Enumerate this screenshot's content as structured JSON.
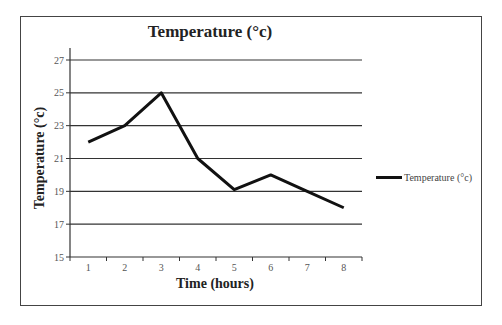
{
  "chart_data": {
    "type": "line",
    "title": "Temperature (°c)",
    "xlabel": "Time (hours)",
    "ylabel": "Temperature (°c)",
    "categories": [
      "1",
      "2",
      "3",
      "4",
      "5",
      "6",
      "7",
      "8"
    ],
    "series": [
      {
        "name": "Temperature (°c)",
        "values": [
          22,
          23,
          25,
          21,
          19.1,
          20,
          19,
          18
        ],
        "color": "#111111"
      }
    ],
    "yticks": [
      15,
      17,
      19,
      21,
      23,
      25,
      27
    ],
    "ylim": [
      15,
      27.7
    ],
    "grid": "horizontal",
    "legend_position": "right"
  }
}
